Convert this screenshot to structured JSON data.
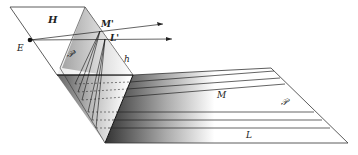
{
  "figure": {
    "labels": {
      "H": "H",
      "E": "E",
      "M_prime": "M'",
      "L_prime": "L'",
      "P_prime": "𝒫'",
      "h": "h",
      "M": "M",
      "P": "𝒫",
      "L": "L"
    },
    "colors": {
      "line": "#222222",
      "plane_dark": "#555555",
      "plane_light": "#ffffff"
    }
  }
}
